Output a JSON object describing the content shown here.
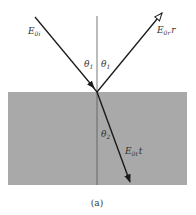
{
  "figure": {
    "caption": "(a)",
    "colors": {
      "medium": "#a9a9a9",
      "ray": "#1a1a1a",
      "normal": "#555555"
    },
    "labels": {
      "incident": {
        "main": "E",
        "sub": "0i",
        "suffix": ""
      },
      "reflected": {
        "main": "E",
        "sub": "0r",
        "suffix": "r"
      },
      "transmitted": {
        "main": "E",
        "sub": "0t",
        "suffix": "t"
      },
      "theta_incident": {
        "main": "θ",
        "sub": "1"
      },
      "theta_reflected": {
        "main": "θ",
        "sub": "1"
      },
      "theta_transmitted": {
        "main": "θ",
        "sub": "2"
      }
    }
  }
}
